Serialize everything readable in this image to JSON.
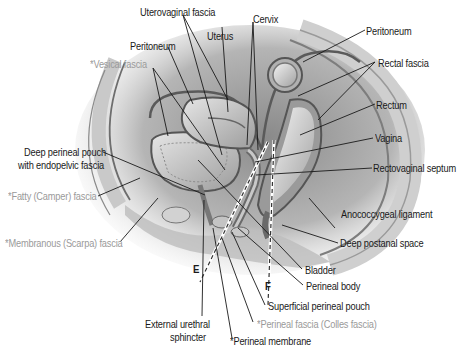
{
  "figure": {
    "type": "anatomical-diagram",
    "note": "Labels prefixed with * appear in gray"
  },
  "labels": {
    "uterovaginal_fascia": "Uterovaginal fascia",
    "cervix": "Cervix",
    "uterus": "Uterus",
    "peritoneum_left": "Peritoneum",
    "peritoneum_right": "Peritoneum",
    "vesical_fascia": "*Vesical  fascia",
    "rectal_fascia": "Rectal fascia",
    "rectum": "Rectum",
    "vagina": "Vagina",
    "deep_perineal_pouch_line1": "Deep perineal pouch",
    "deep_perineal_pouch_line2": "with endopelvic fascia",
    "rectovaginal_septum": "Rectovaginal septum",
    "fatty_camper_fascia": "*Fatty (Camper) fascia",
    "anococcygeal_ligament": "Anococcygeal ligament",
    "membranous_scarpa_fascia": "*Membranous (Scarpa) fascia",
    "deep_postanal_space": "Deep postanal space",
    "marker_e": "E",
    "marker_f": "F",
    "bladder": "Bladder",
    "perineal_body": "Perineal body",
    "superficial_perineal_pouch": "Superficial perineal pouch",
    "external_urethral_sphincter_line1": "External urethral",
    "external_urethral_sphincter_line2": "sphincter",
    "perineal_fascia_colles": "*Perineal fascia (Colles fascia)",
    "perineal_membrane": "*Perineal membrane"
  },
  "colors": {
    "label_text": "#1a1a1a",
    "secondary_label_text": "#9a9a9a",
    "leader_line": "#1a1a1a",
    "tissue_dark": "#6e6e6e",
    "tissue_mid": "#a8a8a8",
    "tissue_light": "#d8d8d8"
  }
}
